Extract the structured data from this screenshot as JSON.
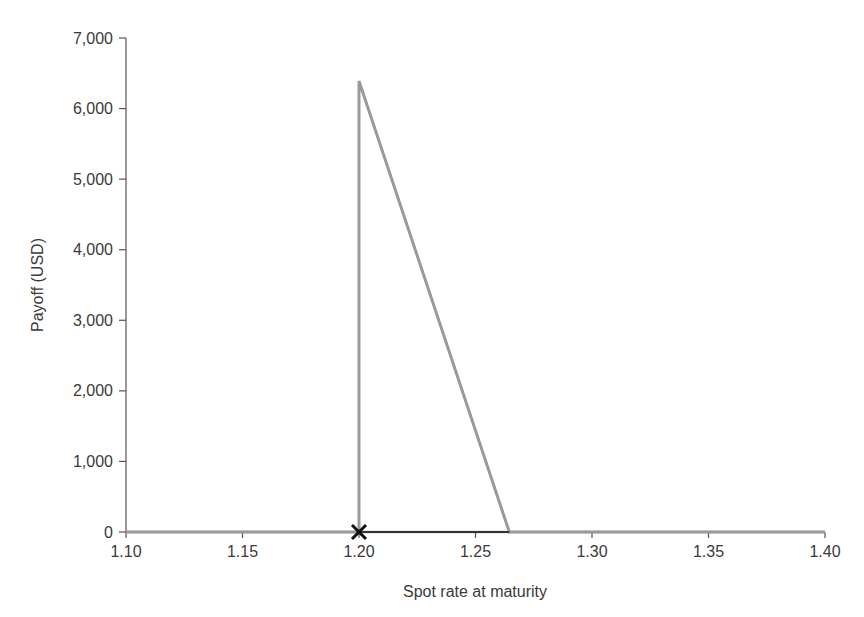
{
  "chart_data": {
    "type": "line",
    "title": "",
    "xlabel": "Spot rate at maturity",
    "ylabel": "Payoff (USD)",
    "xlim": [
      1.1,
      1.4
    ],
    "ylim": [
      0,
      7000
    ],
    "x_ticks": [
      1.1,
      1.15,
      1.2,
      1.25,
      1.3,
      1.35,
      1.4
    ],
    "x_tick_labels": [
      "1.10",
      "1.15",
      "1.20",
      "1.25",
      "1.30",
      "1.35",
      "1.40"
    ],
    "y_ticks": [
      0,
      1000,
      2000,
      3000,
      4000,
      5000,
      6000,
      7000
    ],
    "y_tick_labels": [
      "0",
      "1,000",
      "2,000",
      "3,000",
      "4,000",
      "5,000",
      "6,000",
      "7,000"
    ],
    "grid": false,
    "legend": null,
    "series": [
      {
        "name": "Payoff",
        "color": "#9a9a9a",
        "x": [
          1.1,
          1.2,
          1.2,
          1.2645,
          1.4
        ],
        "y": [
          0,
          0,
          6390,
          0,
          0
        ]
      }
    ],
    "markers": [
      {
        "symbol": "x",
        "x": 1.2,
        "y": 0,
        "color": "#111111"
      }
    ],
    "highlight_segment": {
      "x": [
        1.2,
        1.2645
      ],
      "y": [
        0,
        0
      ],
      "color": "#333333"
    }
  }
}
